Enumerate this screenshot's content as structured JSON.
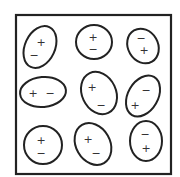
{
  "diagram": {
    "frame": {
      "x": 16,
      "y": 15,
      "width": 155,
      "height": 159,
      "stroke": "#222222"
    },
    "dipoles": [
      {
        "id": 1,
        "cx": 40,
        "cy": 47,
        "rx": 15,
        "ry": 22,
        "rotate": 25,
        "plus": {
          "x": 41,
          "y": 42
        },
        "minus": {
          "x": 34,
          "y": 55
        }
      },
      {
        "id": 2,
        "cx": 94,
        "cy": 42,
        "rx": 18,
        "ry": 17,
        "rotate": 0,
        "plus": {
          "x": 93,
          "y": 37
        },
        "minus": {
          "x": 93,
          "y": 49
        }
      },
      {
        "id": 3,
        "cx": 143,
        "cy": 46,
        "rx": 15,
        "ry": 18,
        "rotate": -30,
        "plus": {
          "x": 144,
          "y": 50
        },
        "minus": {
          "x": 141,
          "y": 38
        }
      },
      {
        "id": 4,
        "cx": 43,
        "cy": 92,
        "rx": 23,
        "ry": 15,
        "rotate": -5,
        "plus": {
          "x": 33,
          "y": 93
        },
        "minus": {
          "x": 50,
          "y": 93
        }
      },
      {
        "id": 5,
        "cx": 99,
        "cy": 93,
        "rx": 17,
        "ry": 22,
        "rotate": -25,
        "plus": {
          "x": 92,
          "y": 87
        },
        "minus": {
          "x": 101,
          "y": 105
        }
      },
      {
        "id": 6,
        "cx": 143,
        "cy": 96,
        "rx": 15,
        "ry": 22,
        "rotate": 30,
        "plus": {
          "x": 135,
          "y": 105
        },
        "minus": {
          "x": 146,
          "y": 90
        }
      },
      {
        "id": 7,
        "cx": 43,
        "cy": 145,
        "rx": 19,
        "ry": 19,
        "rotate": 0,
        "plus": {
          "x": 41,
          "y": 140
        },
        "minus": {
          "x": 41,
          "y": 153
        }
      },
      {
        "id": 8,
        "cx": 93,
        "cy": 144,
        "rx": 17,
        "ry": 22,
        "rotate": -30,
        "plus": {
          "x": 88,
          "y": 139
        },
        "minus": {
          "x": 96,
          "y": 153
        }
      },
      {
        "id": 9,
        "cx": 146,
        "cy": 141,
        "rx": 16,
        "ry": 20,
        "rotate": 0,
        "plus": {
          "x": 146,
          "y": 148
        },
        "minus": {
          "x": 145,
          "y": 134
        }
      }
    ],
    "signs": {
      "plus": "+",
      "minus": "−"
    },
    "stroke_color": "#222222"
  }
}
